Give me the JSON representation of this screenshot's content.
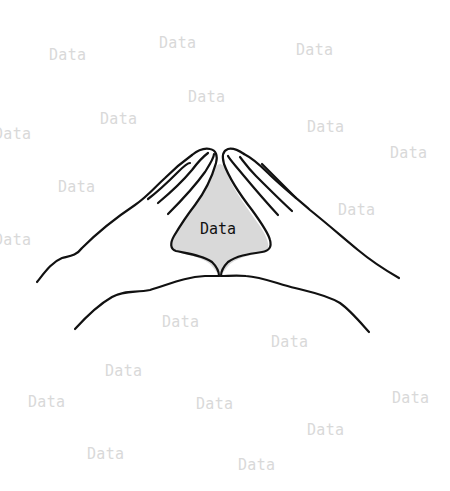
{
  "illustration": {
    "subject": "two hands forming a triangle with fingertips and thumbs touching",
    "center_label": "Data",
    "triangle_fill": "#d9d9d9",
    "stroke_color": "#111111"
  },
  "watermarks": [
    {
      "text": "Data",
      "x": 49,
      "y": 48
    },
    {
      "text": "Data",
      "x": 159,
      "y": 36
    },
    {
      "text": "Data",
      "x": 296,
      "y": 43
    },
    {
      "text": "Data",
      "x": 188,
      "y": 90
    },
    {
      "text": "Data",
      "x": 100,
      "y": 112
    },
    {
      "text": "Data",
      "x": -6,
      "y": 127
    },
    {
      "text": "Data",
      "x": 307,
      "y": 120
    },
    {
      "text": "Data",
      "x": 390,
      "y": 146
    },
    {
      "text": "Data",
      "x": 58,
      "y": 180
    },
    {
      "text": "Data",
      "x": 338,
      "y": 203
    },
    {
      "text": "Data",
      "x": -6,
      "y": 233
    },
    {
      "text": "Data",
      "x": 162,
      "y": 315
    },
    {
      "text": "Data",
      "x": 271,
      "y": 335
    },
    {
      "text": "Data",
      "x": 105,
      "y": 364
    },
    {
      "text": "Data",
      "x": 28,
      "y": 395
    },
    {
      "text": "Data",
      "x": 196,
      "y": 397
    },
    {
      "text": "Data",
      "x": 392,
      "y": 391
    },
    {
      "text": "Data",
      "x": 307,
      "y": 423
    },
    {
      "text": "Data",
      "x": 87,
      "y": 447
    },
    {
      "text": "Data",
      "x": 238,
      "y": 458
    }
  ]
}
